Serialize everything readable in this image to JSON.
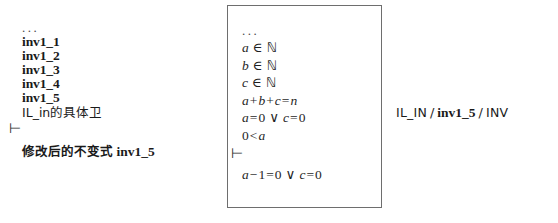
{
  "left_sequent": {
    "ellipsis": "...",
    "hypotheses": [
      "inv1_1",
      "inv1_2",
      "inv1_3",
      "inv1_4",
      "inv1_5"
    ],
    "note_line": "IL_in的具体卫",
    "turnstile": "⊢",
    "goal_prefix": "修改后的不变式",
    "goal_name": "inv1_5"
  },
  "proof_box": {
    "ellipsis": "...",
    "hypotheses": [
      {
        "lhs": "a",
        "op": "∈",
        "rhs": "ℕ"
      },
      {
        "lhs": "b",
        "op": "∈",
        "rhs": "ℕ"
      },
      {
        "lhs": "c",
        "op": "∈",
        "rhs": "ℕ"
      }
    ],
    "sum_line": {
      "a": "a",
      "plus1": "+",
      "b": "b",
      "plus2": "+",
      "c": "c",
      "eq": "=",
      "n": "n"
    },
    "disjunction_line": {
      "left_var": "a",
      "left_eq": "=",
      "left_num": "0",
      "connective": "∨",
      "right_var": "c",
      "right_eq": "=",
      "right_num": "0"
    },
    "positivity_line": {
      "num": "0",
      "rel": "<",
      "var": "a"
    },
    "turnstile": "⊢",
    "goal_line": {
      "var": "a",
      "minus": "−",
      "one": "1",
      "eq": "=",
      "zero": "0",
      "connective": "∨",
      "right_var": "c",
      "right_eq": "=",
      "right_num": "0"
    }
  },
  "rule_label": {
    "source": "IL_IN",
    "sep1": "/",
    "target": "inv1_5",
    "sep2": "/",
    "kind": "INV"
  },
  "colors": {
    "box_border": "#6e6e6e",
    "text": "#1a1a1a",
    "background": "#ffffff"
  }
}
